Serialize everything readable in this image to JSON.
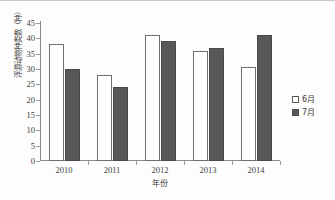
{
  "chart_data": {
    "type": "bar",
    "title": "",
    "subtitle": "",
    "xlabel": "年份",
    "ylabel": "浮游动物种类数（种）",
    "categories": [
      "2010",
      "2011",
      "2012",
      "2013",
      "2014"
    ],
    "series": [
      {
        "name": "6月",
        "values": [
          38,
          28,
          41,
          36,
          30.5
        ],
        "color": "#ffffff",
        "edge_color": "#6f6f6f"
      },
      {
        "name": "7月",
        "values": [
          30,
          24,
          39,
          37,
          41
        ],
        "color": "#585858",
        "edge_color": "#4a4a4a"
      }
    ],
    "ylim": [
      0,
      45
    ],
    "ytick_values": [
      0,
      5,
      10,
      15,
      20,
      25,
      30,
      35,
      40,
      45
    ],
    "ytick_labels": [
      "0",
      "5",
      "10",
      "15",
      "20",
      "25",
      "30",
      "35",
      "40",
      "45"
    ],
    "grid": false,
    "legend_position": "right",
    "legend_entries": [
      "6月",
      "7月"
    ]
  },
  "legend": {
    "items": [
      {
        "label": "6月",
        "swatch": "hollow-square-icon"
      },
      {
        "label": "7月",
        "swatch": "filled-square-icon"
      }
    ]
  },
  "axes": {
    "y_title": "浮游动物种类数（种）",
    "x_title": "年份"
  }
}
